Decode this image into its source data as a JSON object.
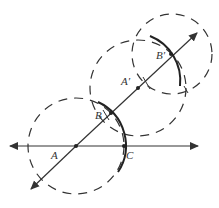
{
  "diagram": {
    "type": "geometric-construction",
    "colors": {
      "stroke": "#333333",
      "background": "#ffffff"
    },
    "labels": {
      "A": "A",
      "B": "B",
      "C": "C",
      "A_prime": "A′",
      "B_prime": "B′"
    }
  }
}
